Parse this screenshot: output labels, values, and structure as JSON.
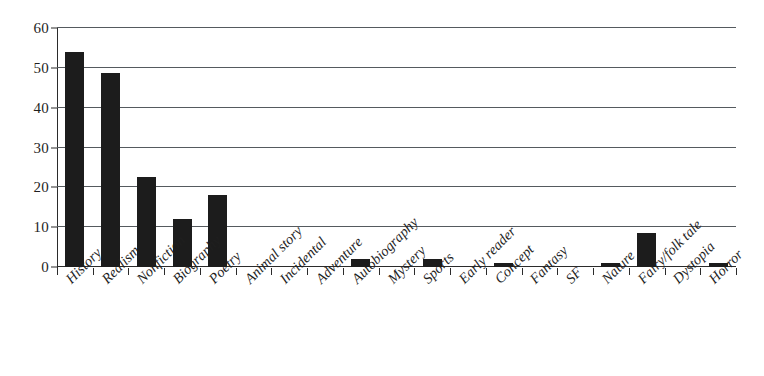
{
  "chart_data": {
    "type": "bar",
    "title": "",
    "subtitle": "",
    "xlabel": "",
    "ylabel": "",
    "ylim": [
      0,
      60
    ],
    "ytick_values": [
      0,
      10,
      20,
      30,
      40,
      50,
      60
    ],
    "ytick_labels": [
      "0",
      "10",
      "20",
      "30",
      "40",
      "50",
      "60"
    ],
    "grid": true,
    "grid_axis": "y",
    "legend": false,
    "legend_position": "none",
    "bar_color": "#1c1c1c",
    "axis_color": "#2b2b2b",
    "gridline_color": "#555a5e",
    "background_color": "#ffffff",
    "xtick_label_rotation": -45,
    "categories": [
      "History",
      "Realism",
      "Nonfiction",
      "Biography",
      "Poetry",
      "Animal story",
      "Incidental",
      "Adventure",
      "Autobiography",
      "Mystery",
      "Sports",
      "Early reader",
      "Concept",
      "Fantasy",
      "SF",
      "Nature",
      "Fairy/folk tale",
      "Dystopia",
      "Horror"
    ],
    "values": [
      54,
      48.7,
      22.7,
      12,
      18,
      0,
      0,
      0,
      2,
      0,
      2,
      0,
      1,
      0,
      0,
      1,
      8.5,
      0,
      1
    ]
  }
}
